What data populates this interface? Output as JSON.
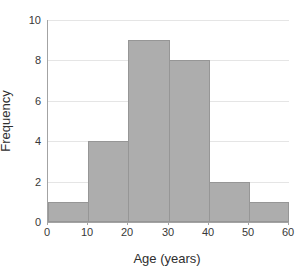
{
  "chart_data": {
    "type": "bar",
    "subtype": "histogram",
    "bin_edges": [
      0,
      10,
      20,
      30,
      40,
      50,
      60
    ],
    "categories": [
      "0-10",
      "10-20",
      "20-30",
      "30-40",
      "40-50",
      "50-60"
    ],
    "values": [
      1,
      4,
      9,
      8,
      2,
      1
    ],
    "xlabel": "Age (years)",
    "ylabel": "Frequency",
    "xlim": [
      0,
      60
    ],
    "ylim": [
      0,
      10
    ],
    "xticks": [
      0,
      10,
      20,
      30,
      40,
      50,
      60
    ],
    "yticks": [
      0,
      2,
      4,
      6,
      8,
      10
    ],
    "grid": true,
    "legend_position": "none",
    "colors": {
      "bar_fill": "#adadad",
      "bar_border": "#969696",
      "gridline": "#e5e5e5",
      "axis_line": "#a3a3a3",
      "tick_text": "#383838",
      "title_text": "#2e2e2e",
      "background": "#ffffff"
    }
  }
}
